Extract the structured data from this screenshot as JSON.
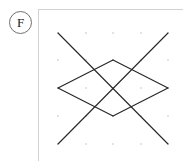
{
  "figure": {
    "label": {
      "text": "F",
      "shape": "circle",
      "icon_name": "circled-letter-label"
    },
    "panel": {
      "background_color": "#ffffff",
      "border_color": "#d2d2d2",
      "x": 38,
      "y": 9,
      "width": 145,
      "height": 152
    },
    "dot_grid": {
      "visible": true,
      "color": "#d8d8d8",
      "dot_radius": 1.0,
      "columns": 5,
      "rows": 5,
      "x_positions": [
        57,
        85,
        112,
        140,
        167
      ],
      "y_positions": [
        32,
        59,
        87,
        115,
        143
      ],
      "spacing_x": 27.5,
      "spacing_y": 27.75
    },
    "stroke": {
      "color": "#262626",
      "width": 1.1,
      "linecap": "round"
    },
    "segments": [
      {
        "name": "long-diagonal-down-right",
        "x1": 57,
        "y1": 32,
        "x2": 167,
        "y2": 143
      },
      {
        "name": "long-diagonal-up-right",
        "x1": 57,
        "y1": 143,
        "x2": 167,
        "y2": 32
      },
      {
        "name": "diamond-upper-left-edge",
        "x1": 57,
        "y1": 87,
        "x2": 112,
        "y2": 59
      },
      {
        "name": "diamond-upper-right-edge",
        "x1": 112,
        "y1": 59,
        "x2": 167,
        "y2": 87
      },
      {
        "name": "diamond-lower-left-edge",
        "x1": 57,
        "y1": 87,
        "x2": 112,
        "y2": 115
      },
      {
        "name": "diamond-lower-right-edge",
        "x1": 112,
        "y1": 115,
        "x2": 167,
        "y2": 87
      }
    ],
    "vertices": [
      {
        "name": "left-vertex",
        "x": 57,
        "y": 87
      },
      {
        "name": "right-vertex",
        "x": 167,
        "y": 87
      },
      {
        "name": "top-crossing",
        "x": 112,
        "y": 59
      },
      {
        "name": "bottom-crossing",
        "x": 112,
        "y": 115
      },
      {
        "name": "top-left-endpoint",
        "x": 57,
        "y": 32
      },
      {
        "name": "top-right-endpoint",
        "x": 167,
        "y": 32
      },
      {
        "name": "bottom-left-endpoint",
        "x": 57,
        "y": 143
      },
      {
        "name": "bottom-right-endpoint",
        "x": 167,
        "y": 143
      }
    ]
  }
}
